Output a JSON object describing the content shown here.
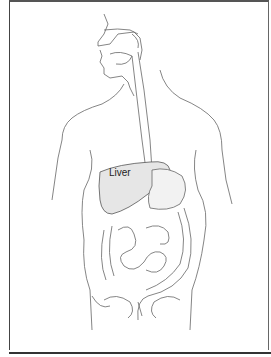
{
  "figure": {
    "highlighted_organ": "liver",
    "labels": [
      {
        "id": "liver",
        "text": "Liver",
        "x": 109,
        "y": 173
      }
    ],
    "colors": {
      "line": "#555555",
      "liver_fill": "#e4e4e4",
      "frame": "#444444",
      "background": "#ffffff"
    }
  }
}
